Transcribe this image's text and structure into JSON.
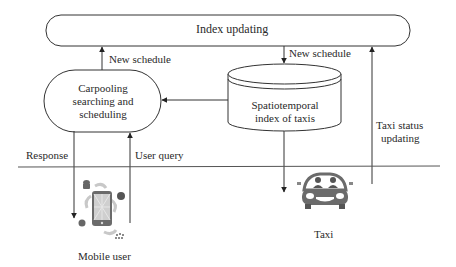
{
  "diagram": {
    "nodes": {
      "index_updating": {
        "label": "Index updating"
      },
      "carpooling": {
        "line1": "Carpooling",
        "line2": "searching and",
        "line3": "scheduling"
      },
      "spatiotemporal_index": {
        "line1": "Spatiotemporal",
        "line2": "index of taxis"
      },
      "mobile_user": {
        "label": "Mobile user",
        "icon": "smartphone-icon"
      },
      "taxi": {
        "label": "Taxi",
        "icon": "taxi-car-icon"
      }
    },
    "edges": {
      "new_schedule_left": "New schedule",
      "new_schedule_right": "New schedule",
      "response": "Response",
      "user_query": "User query",
      "taxi_status_line1": "Taxi status",
      "taxi_status_line2": "updating"
    },
    "colors": {
      "stroke": "#333333",
      "icon_gray": "#6b6b6b",
      "phone_accent": "#bdbdbd"
    }
  }
}
